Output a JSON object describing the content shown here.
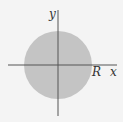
{
  "diagram": {
    "labels": {
      "x_axis": "x",
      "y_axis": "y",
      "radius": "R"
    },
    "colors": {
      "background": "#f4f4f4",
      "disk": "#c4c4c4",
      "axes": "#555555",
      "text": "#333333"
    }
  }
}
